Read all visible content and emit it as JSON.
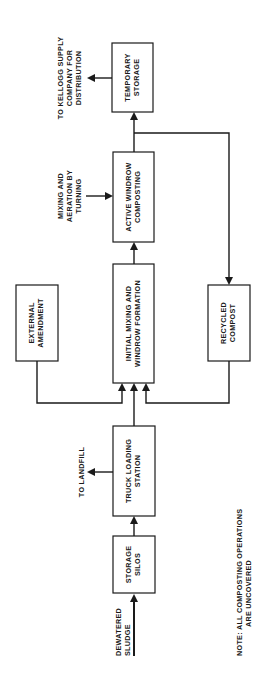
{
  "diagram": {
    "orientation": "rotated -90deg (reads bottom-to-top)",
    "boxes": {
      "storage_silos": [
        "STORAGE",
        "SILOS"
      ],
      "truck_loading": [
        "TRUCK LOADING",
        "STATION"
      ],
      "initial_mixing": [
        "INITIAL MIXING AND",
        "WINDROW FORMATION"
      ],
      "active_windrow": [
        "ACTIVE WINDROW",
        "COMPOSTING"
      ],
      "temporary_storage": [
        "TEMPORARY",
        "STORAGE"
      ],
      "external_amendment": [
        "EXTERNAL",
        "AMENDMENT"
      ],
      "recycled_compost": [
        "RECYCLED",
        "COMPOST"
      ]
    },
    "labels": {
      "dewatered_sludge": [
        "DEWATERED",
        "SLUDGE"
      ],
      "to_landfill": [
        "TO LANDFILL"
      ],
      "mixing_aeration": [
        "MIXING AND",
        "AERATION BY",
        "TURNING"
      ],
      "to_kellogg": [
        "TO KELLOGG SUPPLY",
        "COMPANY FOR",
        "DISTRIBUTION"
      ]
    },
    "note": [
      "NOTE:  ALL  COMPOSTING OPERATIONS",
      "ARE UNCOVERED"
    ],
    "colors": {
      "ink": "#1a1a1a",
      "background": "#ffffff"
    }
  }
}
